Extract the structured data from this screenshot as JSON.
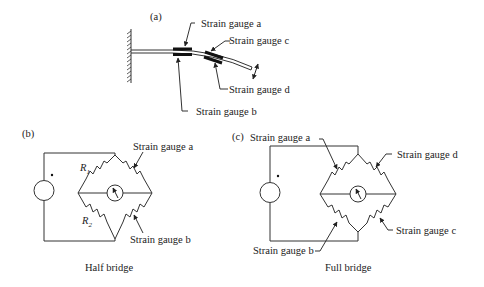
{
  "panels": {
    "a": {
      "tag": "(a)",
      "labels": {
        "gauge_a": "Strain gauge a",
        "gauge_b": "Strain gauge b",
        "gauge_c": "Strain gauge c",
        "gauge_d": "Strain gauge d"
      }
    },
    "b": {
      "tag": "(b)",
      "caption": "Half bridge",
      "labels": {
        "r1": "R",
        "r1_sub": "1",
        "r2": "R",
        "r2_sub": "2",
        "gauge_a": "Strain gauge a",
        "gauge_b": "Strain gauge b"
      }
    },
    "c": {
      "tag": "(c)",
      "caption": "Full bridge",
      "labels": {
        "gauge_a": "Strain gauge a",
        "gauge_b": "Strain gauge b",
        "gauge_c": "Strain gauge c",
        "gauge_d": "Strain gauge d"
      }
    }
  }
}
